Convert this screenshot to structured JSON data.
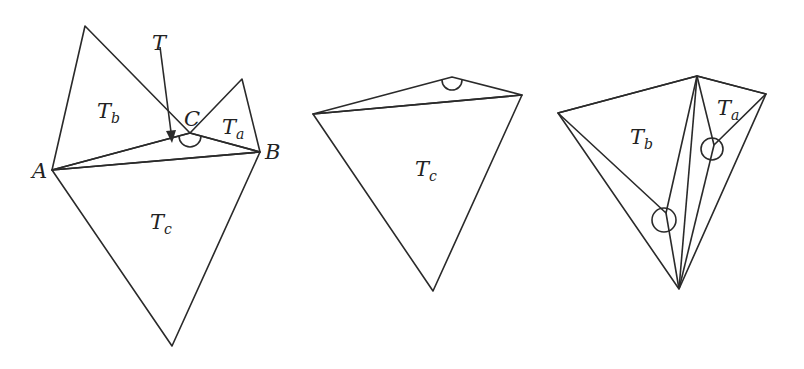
{
  "figure": {
    "panels": [
      {
        "id": "left",
        "labels": {
          "Tb_main": "T",
          "Tb_sub": "b",
          "Ta_main": "T",
          "Ta_sub": "a",
          "Tc_main": "T",
          "Tc_sub": "c",
          "T": "T",
          "A": "A",
          "B": "B",
          "C": "C"
        }
      },
      {
        "id": "middle",
        "labels": {
          "Tc_main": "T",
          "Tc_sub": "c"
        }
      },
      {
        "id": "right",
        "labels": {
          "Tb_main": "T",
          "Tb_sub": "b",
          "Ta_main": "T",
          "Ta_sub": "a"
        }
      }
    ],
    "colors": {
      "dark_fill": "#b5b5b5",
      "medium_fill": "#cdcdcd",
      "light_fill": "#ececec",
      "stroke": "#2a2a2a",
      "background": "#ffffff"
    }
  }
}
